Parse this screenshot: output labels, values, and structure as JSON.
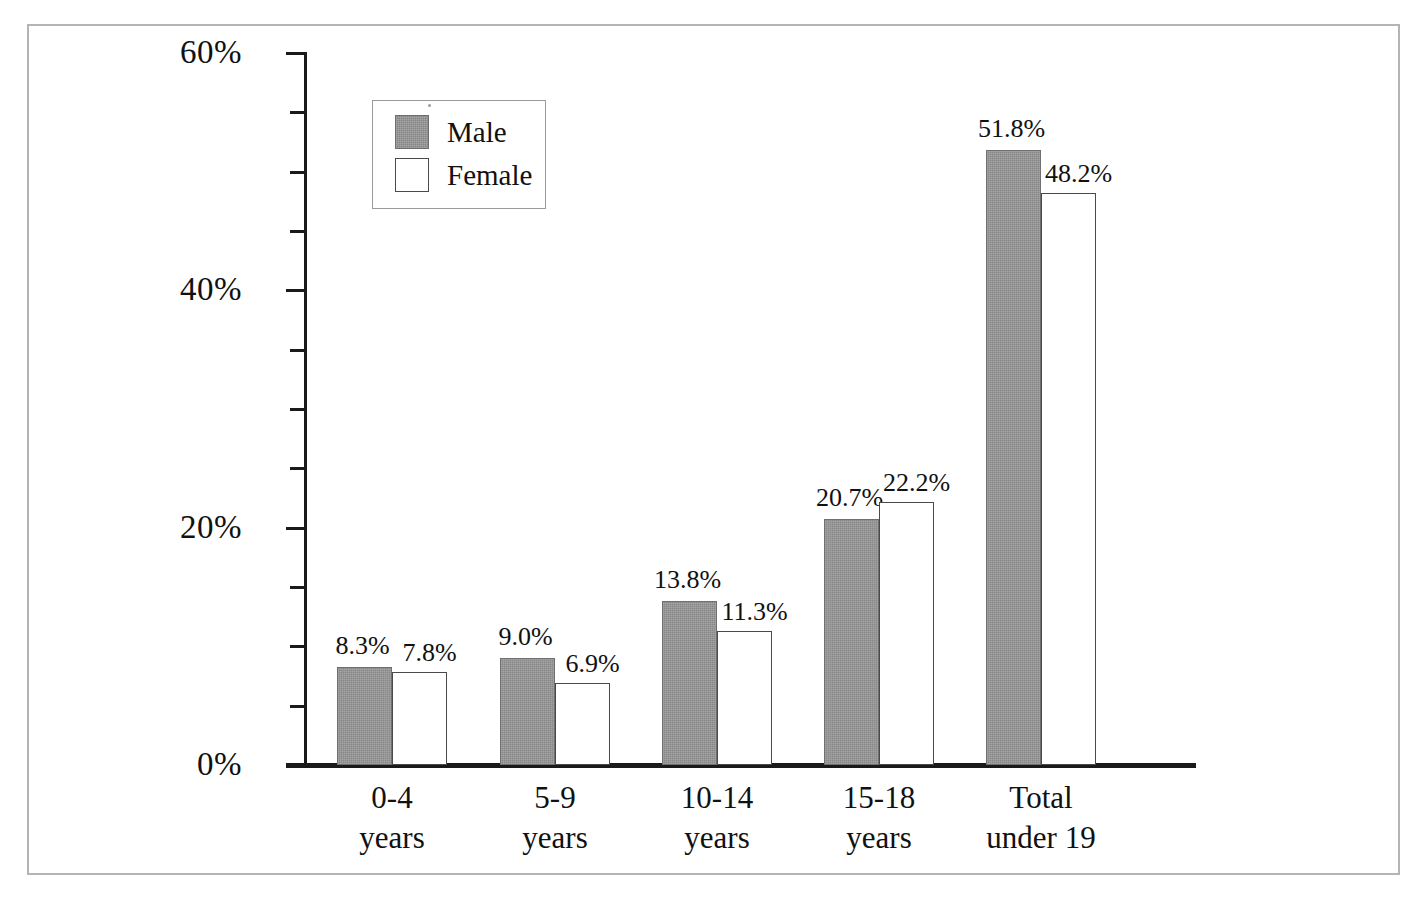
{
  "chart_data": {
    "type": "bar",
    "title": "",
    "subtitle": "",
    "xlabel": "",
    "ylabel": "",
    "ylim": [
      0,
      60
    ],
    "y_tick_labels": [
      "0%",
      "20%",
      "40%",
      "60%"
    ],
    "y_tick_values": [
      0,
      20,
      40,
      60
    ],
    "y_minor_tick_values": [
      5,
      10,
      15,
      25,
      30,
      35,
      45,
      50,
      55
    ],
    "grid": false,
    "legend_position": "top-left-inside",
    "categories": [
      "0-4 years",
      "5-9 years",
      "10-14 years",
      "15-18 years",
      "Total under 19"
    ],
    "category_lines": [
      {
        "line1": "0-4",
        "line2": "years"
      },
      {
        "line1": "5-9",
        "line2": "years"
      },
      {
        "line1": "10-14",
        "line2": "years"
      },
      {
        "line1": "15-18",
        "line2": "years"
      },
      {
        "line1": "Total",
        "line2": "under 19"
      }
    ],
    "series": [
      {
        "name": "Male",
        "color": "#878787",
        "values": [
          8.3,
          9.0,
          13.8,
          20.7,
          51.8
        ],
        "labels": [
          "8.3%",
          "9.0%",
          "13.8%",
          "20.7%",
          "51.8%"
        ]
      },
      {
        "name": "Female",
        "color": "#ffffff",
        "values": [
          7.8,
          6.9,
          11.3,
          22.2,
          48.2
        ],
        "labels": [
          "7.8%",
          "6.9%",
          "11.3%",
          "22.2%",
          "48.2%"
        ]
      }
    ]
  },
  "legend": {
    "entries": [
      {
        "label": "Male",
        "swatch": "gray-filled-square"
      },
      {
        "label": "Female",
        "swatch": "white-outlined-square"
      }
    ]
  },
  "colors": {
    "male_fill": "#878787",
    "female_fill": "#ffffff",
    "axis": "#1a1a1a",
    "text": "#111111",
    "page_frame": "#b4b4b4"
  }
}
